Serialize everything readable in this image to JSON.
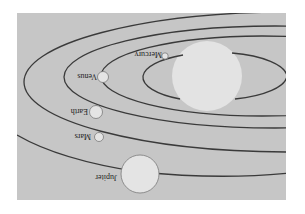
{
  "diagram": {
    "orientation": "rotated 180 degrees",
    "colors": {
      "panel": "#c6c6c6",
      "sun": "#e3e3e3",
      "orbit": "#3a3a3a",
      "planet": "#e4e4e4"
    },
    "planets": [
      {
        "name": "Mercury"
      },
      {
        "name": "Venus"
      },
      {
        "name": "Earth"
      },
      {
        "name": "Mars"
      },
      {
        "name": "Jupiter"
      }
    ]
  }
}
